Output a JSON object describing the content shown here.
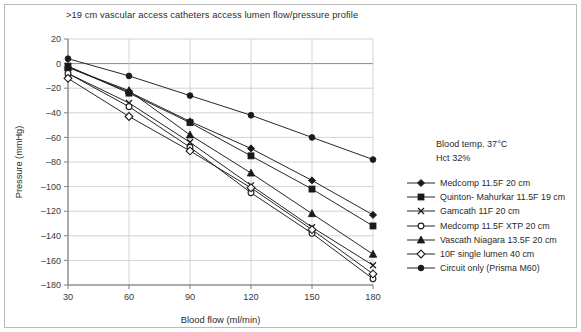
{
  "chart_data": {
    "type": "line",
    "title": ">19 cm vascular access catheters access lumen flow/pressure profile",
    "xlabel": "Blood flow (ml/min)",
    "ylabel": "Pressure (mmHg)",
    "x": [
      30,
      60,
      90,
      120,
      150,
      180
    ],
    "xticks": [
      "30",
      "60",
      "90",
      "120",
      "150",
      "180"
    ],
    "yticks": [
      "20",
      "0",
      "–20",
      "–40",
      "–60",
      "–80",
      "–100",
      "–120",
      "–140",
      "–160",
      "–180"
    ],
    "ylim": [
      -180,
      20
    ],
    "xlim": [
      30,
      180
    ],
    "grid": true,
    "legend_position": "right",
    "series": [
      {
        "name": "Medcomp 11.5F 20 cm",
        "marker": "filled-diamond",
        "color": "#1a1a1a",
        "values": [
          -3,
          -23,
          -47,
          -69,
          -95,
          -123
        ]
      },
      {
        "name": "Quinton- Mahurkar 11.5F 19 cm",
        "marker": "filled-square",
        "color": "#1a1a1a",
        "values": [
          -2,
          -24,
          -48,
          -75,
          -102,
          -132
        ]
      },
      {
        "name": "Gamcath 11F 20 cm",
        "marker": "cross-x",
        "color": "#1a1a1a",
        "values": [
          -8,
          -32,
          -64,
          -99,
          -133,
          -164
        ]
      },
      {
        "name": "Medcomp 11.5F XTP 20 cm",
        "marker": "open-circle",
        "color": "#1a1a1a",
        "values": [
          -8,
          -35,
          -68,
          -105,
          -138,
          -175
        ]
      },
      {
        "name": "Vascath Niagara 13.5F 20 cm",
        "marker": "filled-triangle",
        "color": "#1a1a1a",
        "values": [
          -3,
          -22,
          -58,
          -89,
          -122,
          -155
        ]
      },
      {
        "name": "10F single lumen 40 cm",
        "marker": "open-diamond",
        "color": "#1a1a1a",
        "values": [
          -12,
          -43,
          -71,
          -101,
          -135,
          -171
        ]
      },
      {
        "name": "Circuit only (Prisma M60)",
        "marker": "filled-circle",
        "color": "#1a1a1a",
        "values": [
          4,
          -10,
          -26,
          -42,
          -60,
          -78
        ]
      }
    ],
    "annotations": [
      "Blood temp. 37°C",
      "Hct 32%"
    ]
  }
}
